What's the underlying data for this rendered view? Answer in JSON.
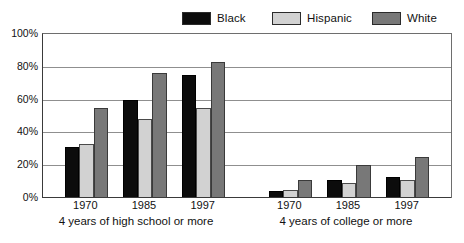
{
  "legend": {
    "items": [
      {
        "label": "Black",
        "color": "#0c0c0c",
        "key": "black"
      },
      {
        "label": "Hispanic",
        "color": "#d2d2d2",
        "key": "hispanic"
      },
      {
        "label": "White",
        "color": "#787878",
        "key": "white"
      }
    ]
  },
  "axis": {
    "y_ticks": [
      "0%",
      "20%",
      "40%",
      "60%",
      "80%",
      "100%"
    ],
    "y_min": 0,
    "y_max": 100
  },
  "groups": {
    "high_school": {
      "caption": "4 years of high school or more",
      "years": [
        "1970",
        "1985",
        "1997"
      ]
    },
    "college": {
      "caption": "4 years of college or more",
      "years": [
        "1970",
        "1985",
        "1997"
      ]
    }
  },
  "chart_data": {
    "type": "bar",
    "title": "",
    "subtitle": "",
    "xlabel": "",
    "ylabel": "",
    "ylim": [
      0,
      100
    ],
    "y_ticks": [
      0,
      20,
      40,
      60,
      80,
      100
    ],
    "y_tick_labels": [
      "0%",
      "20%",
      "40%",
      "60%",
      "80%",
      "100%"
    ],
    "grid": "horizontal",
    "legend_position": "top-right",
    "panels": [
      {
        "name": "4 years of high school or more",
        "categories": [
          "1970",
          "1985",
          "1997"
        ],
        "series": [
          {
            "name": "Black",
            "values": [
              31,
              60,
              75
            ]
          },
          {
            "name": "Hispanic",
            "values": [
              33,
              48,
              55
            ]
          },
          {
            "name": "White",
            "values": [
              55,
              76,
              83
            ]
          }
        ]
      },
      {
        "name": "4 years of college or more",
        "categories": [
          "1970",
          "1985",
          "1997"
        ],
        "series": [
          {
            "name": "Black",
            "values": [
              4,
              11,
              13
            ]
          },
          {
            "name": "Hispanic",
            "values": [
              5,
              9,
              11
            ]
          },
          {
            "name": "White",
            "values": [
              11,
              20,
              25
            ]
          }
        ]
      }
    ],
    "series_colors": {
      "Black": "#0c0c0c",
      "Hispanic": "#d2d2d2",
      "White": "#787878"
    }
  }
}
